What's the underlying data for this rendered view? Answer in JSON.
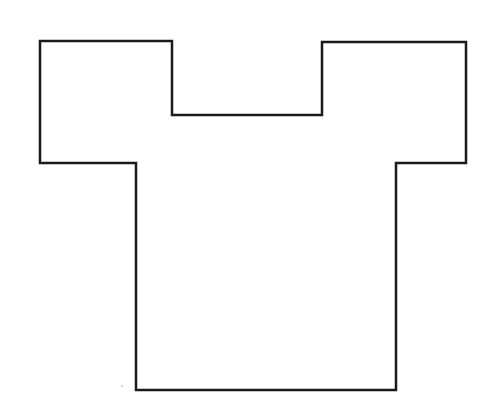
{
  "figure": {
    "background": "#ffffff",
    "stroke_color": "#1a1a1a",
    "stroke_width": 2.5,
    "shape": {
      "type": "rectilinear-polygon",
      "description": "T-shirt-like outline",
      "points": [
        [
          40,
          41
        ],
        [
          172,
          41
        ],
        [
          172,
          115
        ],
        [
          322,
          115
        ],
        [
          322,
          42
        ],
        [
          466,
          42
        ],
        [
          466,
          163
        ],
        [
          396,
          163
        ],
        [
          396,
          390
        ],
        [
          136,
          390
        ],
        [
          136,
          163
        ],
        [
          40,
          163
        ]
      ]
    },
    "stray_mark": {
      "x": 122,
      "y": 386
    }
  }
}
